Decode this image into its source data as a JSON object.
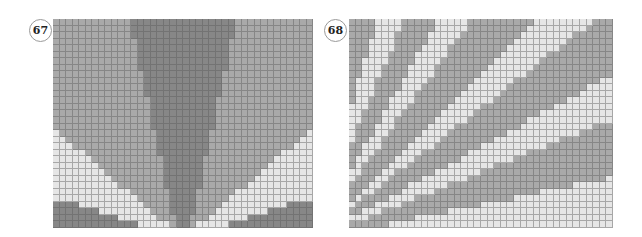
{
  "figures": [
    {
      "id": "fig-67",
      "label": "67",
      "label_pos": {
        "left": 29,
        "top": 19
      },
      "panel": {
        "left": 53,
        "top": 19,
        "width": 260,
        "height": 209
      },
      "grid": {
        "cols": 40,
        "rows": 32
      },
      "pattern": "fan-center-bottom",
      "shades": {
        "light": "#e6e6e6",
        "medium": "#a9a9a9",
        "dark": "#878787"
      }
    },
    {
      "id": "fig-68",
      "label": "68",
      "label_pos": {
        "left": 324,
        "top": 19
      },
      "panel": {
        "left": 349,
        "top": 19,
        "width": 264,
        "height": 209
      },
      "grid": {
        "cols": 40,
        "rows": 32
      },
      "pattern": "rays-bottom-left",
      "shades": {
        "light": "#e6e6e6",
        "medium": "#a9a9a9"
      }
    }
  ]
}
